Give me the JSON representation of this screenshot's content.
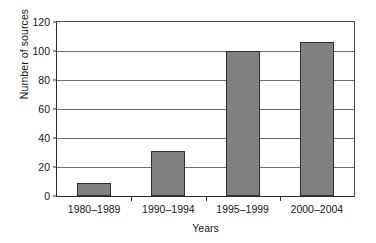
{
  "chart_data": {
    "type": "bar",
    "title": "",
    "xlabel": "Years",
    "ylabel": "Number of sources",
    "categories": [
      "1980–1989",
      "1990–1994",
      "1995–1999",
      "2000–2004"
    ],
    "values": [
      9,
      31,
      100,
      106
    ],
    "ylim": [
      0,
      120
    ],
    "yticks": [
      0,
      20,
      40,
      60,
      80,
      100,
      120
    ],
    "ytick_labels": [
      "0",
      "20",
      "40",
      "60",
      "80",
      "100",
      "120"
    ],
    "grid": "horizontal",
    "legend": "none",
    "bar_color": "#808080",
    "bar_edge_color": "#2f2f2f",
    "axis_color": "#2a2a2a",
    "gridline_color": "#6e6e6e",
    "background": "#ffffff"
  }
}
